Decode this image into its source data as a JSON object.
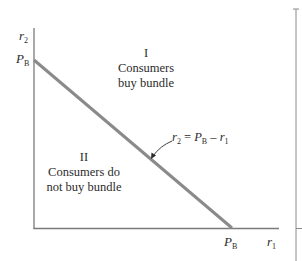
{
  "diagram": {
    "axes": {
      "y_label": {
        "var": "r",
        "sub": "2"
      },
      "x_label": {
        "var": "r",
        "sub": "1"
      },
      "y_intercept_label": {
        "var": "P",
        "sub": "B"
      },
      "x_intercept_label": {
        "var": "P",
        "sub": "B"
      }
    },
    "line": {
      "equation": {
        "lhs_var": "r",
        "lhs_sub": "2",
        "eq": " = ",
        "p_var": "P",
        "p_sub": "B",
        "minus": " – ",
        "rhs_var": "r",
        "rhs_sub": "1"
      },
      "color": "#8a8a8a"
    },
    "regions": [
      {
        "numeral": "I",
        "line1": "Consumers",
        "line2": "buy bundle"
      },
      {
        "numeral": "II",
        "line1": "Consumers do",
        "line2": "not buy bundle"
      }
    ],
    "colors": {
      "axis": "#7a7a7a",
      "text": "#2b2b2b",
      "divider": "#8a8a8a"
    }
  }
}
